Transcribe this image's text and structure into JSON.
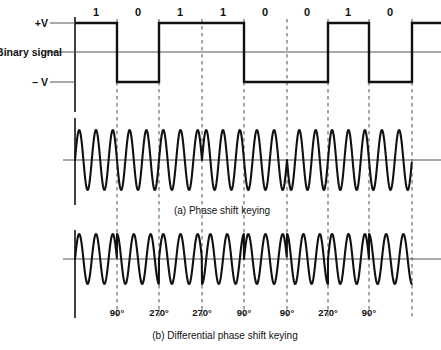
{
  "figure": {
    "axis_labels": {
      "plus_v": "+V",
      "minus_v": "– V",
      "binary_signal": "Binary signal"
    },
    "captions": {
      "a": "(a) Phase shift keying",
      "b": "(b) Differential phase shift keying"
    }
  },
  "chart_data": {
    "type": "line",
    "title": "",
    "xlabel": "",
    "ylabel": "",
    "grid": false,
    "legend_position": "none",
    "bit_sequence": [
      "1",
      "0",
      "1",
      "1",
      "0",
      "0",
      "1",
      "0"
    ],
    "bit_boundaries_px": [
      75,
      117,
      159,
      202,
      244,
      287,
      328,
      369,
      412
    ],
    "bit_centers_px": [
      96,
      138,
      180,
      223,
      265,
      307,
      348,
      390
    ],
    "binary_levels": [
      "+V",
      "-V",
      "+V",
      "+V",
      "-V",
      "-V",
      "+V",
      "-V"
    ],
    "psk_phases_deg": [
      0,
      180,
      0,
      0,
      180,
      180,
      0,
      180
    ],
    "dpsk_phase_shifts": [
      "",
      "90°",
      "270°",
      "270°",
      "90°",
      "90°",
      "270°",
      "90°"
    ],
    "dpsk_shift_labels": [
      {
        "x": 117,
        "text": "90°"
      },
      {
        "x": 159,
        "text": "270°"
      },
      {
        "x": 202,
        "text": "270°"
      },
      {
        "x": 244,
        "text": "90°"
      },
      {
        "x": 287,
        "text": "90°"
      },
      {
        "x": 328,
        "text": "270°"
      },
      {
        "x": 369,
        "text": "90°"
      }
    ],
    "series": [
      {
        "name": "Binary signal",
        "kind": "square"
      },
      {
        "name": "Phase shift keying",
        "kind": "psk"
      },
      {
        "name": "Differential phase shift keying",
        "kind": "dpsk"
      }
    ],
    "ylim_binary": [
      "-V",
      "+V"
    ],
    "cycles_per_bit": 2.5
  },
  "colors": {
    "stroke": "#111111",
    "thin": "#555555",
    "dash": "#777777",
    "background": "#ffffff"
  }
}
